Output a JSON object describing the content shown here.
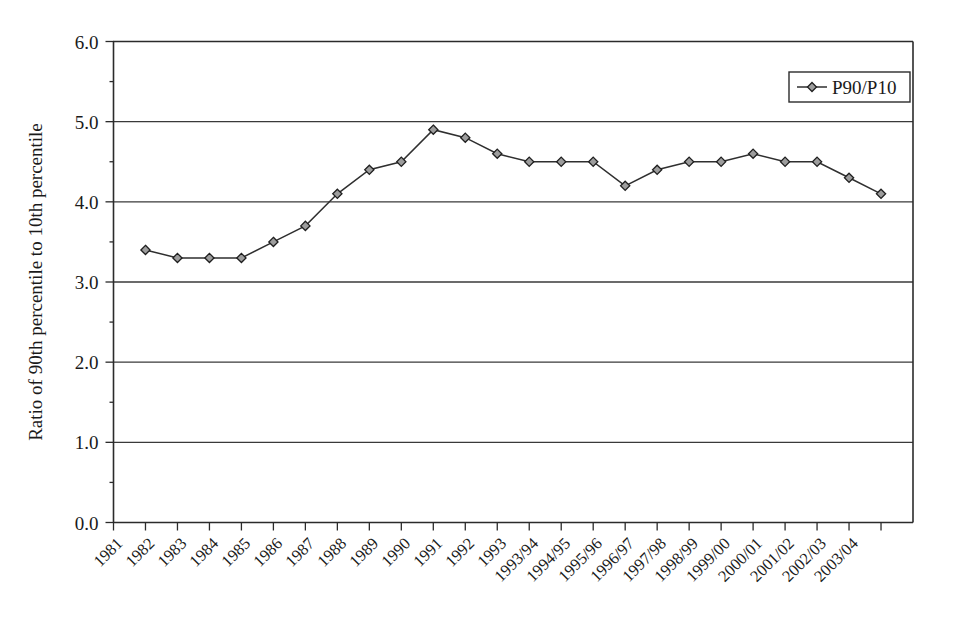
{
  "chart_data": {
    "type": "line",
    "title": "",
    "xlabel": "",
    "ylabel": "Ratio of 90th percentile to 10th percentile",
    "ylim": [
      0.0,
      6.0
    ],
    "ytick_labels": [
      "0.0",
      "1.0",
      "2.0",
      "3.0",
      "4.0",
      "5.0",
      "6.0"
    ],
    "ytick_values": [
      0.0,
      1.0,
      2.0,
      3.0,
      4.0,
      5.0,
      6.0
    ],
    "grid": "horizontal",
    "legend_position": "top-right",
    "categories": [
      "1981",
      "1982",
      "1983",
      "1984",
      "1985",
      "1986",
      "1987",
      "1988",
      "1989",
      "1990",
      "1991",
      "1992",
      "1993",
      "1993/94",
      "1994/95",
      "1995/96",
      "1996/97",
      "1997/98",
      "1998/99",
      "1999/00",
      "2000/01",
      "2001/02",
      "2002/03",
      "2003/04"
    ],
    "series": [
      {
        "name": "P90/P10",
        "values": [
          null,
          3.4,
          3.3,
          3.3,
          3.3,
          3.5,
          3.7,
          4.1,
          4.4,
          4.5,
          4.9,
          4.8,
          4.6,
          4.5,
          4.5,
          4.5,
          4.2,
          4.4,
          4.5,
          4.5,
          4.6,
          4.5,
          4.5,
          4.3
        ]
      }
    ],
    "extra_points": [
      {
        "x_index": 24,
        "value": 4.1
      }
    ],
    "legend": [
      "P90/P10"
    ],
    "marker_style": "diamond",
    "line_color": "#2f2f2f",
    "marker_fill": "#9d9d9d"
  },
  "legend": {
    "entry_label": "P90/P10"
  },
  "axes": {
    "y_title": "Ratio of 90th percentile to 10th percentile",
    "y_labels": [
      "6.0",
      "5.0",
      "4.0",
      "3.0",
      "2.0",
      "1.0",
      "0.0"
    ],
    "x_labels": [
      "1981",
      "1982",
      "1983",
      "1984",
      "1985",
      "1986",
      "1987",
      "1988",
      "1989",
      "1990",
      "1991",
      "1992",
      "1993",
      "1993/94",
      "1994/95",
      "1995/96",
      "1996/97",
      "1997/98",
      "1998/99",
      "1999/00",
      "2000/01",
      "2001/02",
      "2002/03",
      "2003/04"
    ]
  }
}
